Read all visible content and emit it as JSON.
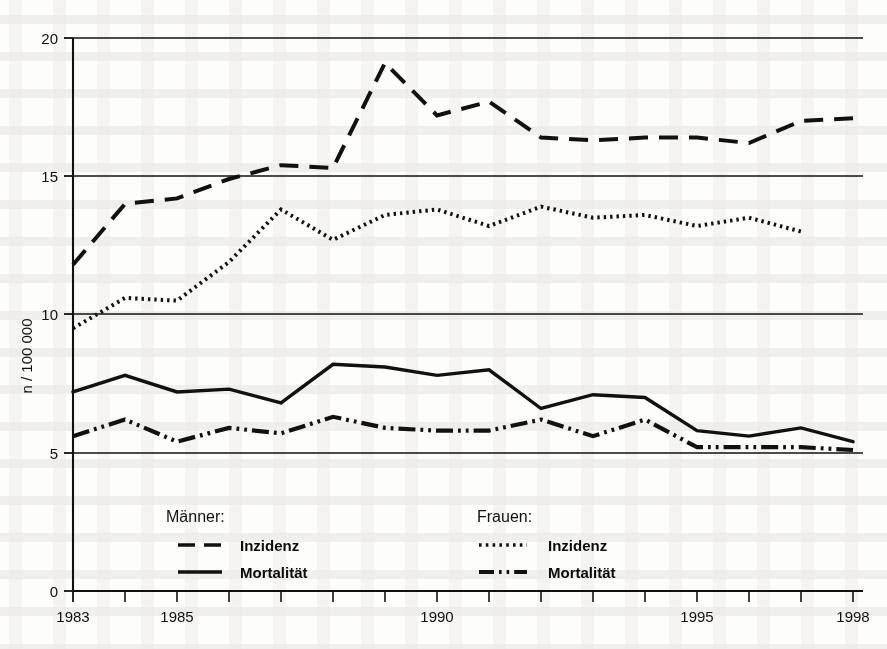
{
  "chart_data": {
    "type": "line",
    "title": "",
    "subtitle": "",
    "xlabel": "",
    "ylabel": "n / 100 000",
    "xlim": [
      1983,
      1998
    ],
    "ylim": [
      0,
      20
    ],
    "ytick_labels": [
      "0",
      "5",
      "10",
      "15",
      "20"
    ],
    "ytick_values": [
      0,
      5,
      10,
      15,
      20
    ],
    "xtick_values": [
      1983,
      1984,
      1985,
      1986,
      1987,
      1988,
      1989,
      1990,
      1991,
      1992,
      1993,
      1994,
      1995,
      1996,
      1997,
      1998
    ],
    "xtick_labels_shown": [
      "1983",
      "1985",
      "1990",
      "1995",
      "1998"
    ],
    "xtick_labeled_values": [
      1983,
      1985,
      1990,
      1995,
      1998
    ],
    "grid": "horizontal",
    "legend_position": "inside-bottom",
    "x": [
      1983,
      1984,
      1985,
      1986,
      1987,
      1988,
      1989,
      1990,
      1991,
      1992,
      1993,
      1994,
      1995,
      1996,
      1997,
      1998
    ],
    "series": [
      {
        "name": "Männer Inzidenz",
        "group": "Männer",
        "measure": "Inzidenz",
        "style": "dashed",
        "color": "#111111",
        "values": [
          11.8,
          14.0,
          14.2,
          14.9,
          15.4,
          15.3,
          19.1,
          17.2,
          17.7,
          16.4,
          16.3,
          16.4,
          16.4,
          16.2,
          17.0,
          17.1
        ]
      },
      {
        "name": "Frauen Inzidenz",
        "group": "Frauen",
        "measure": "Inzidenz",
        "style": "dotted",
        "color": "#111111",
        "values": [
          9.5,
          10.6,
          10.5,
          11.9,
          13.8,
          12.7,
          13.6,
          13.8,
          13.2,
          13.9,
          13.5,
          13.6,
          13.2,
          13.5,
          13.0,
          null
        ]
      },
      {
        "name": "Männer Mortalität",
        "group": "Männer",
        "measure": "Mortalität",
        "style": "solid",
        "color": "#111111",
        "values": [
          7.2,
          7.8,
          7.2,
          7.3,
          6.8,
          8.2,
          8.1,
          7.8,
          8.0,
          6.6,
          7.1,
          7.0,
          5.8,
          5.6,
          5.9,
          5.4
        ]
      },
      {
        "name": "Frauen Mortalität",
        "group": "Frauen",
        "measure": "Mortalität",
        "style": "dash-dot-dot",
        "color": "#111111",
        "values": [
          5.6,
          6.2,
          5.4,
          5.9,
          5.7,
          6.3,
          5.9,
          5.8,
          5.8,
          6.2,
          5.6,
          6.2,
          5.2,
          5.2,
          5.2,
          5.1
        ]
      }
    ]
  },
  "axes": {
    "y_axis_title": "n / 100 000",
    "y_ticks": [
      "20",
      "15",
      "10",
      "5",
      "0"
    ],
    "x_ticks": [
      "1983",
      "1985",
      "1990",
      "1995",
      "1998"
    ]
  },
  "legend": {
    "groups": [
      {
        "heading": "Männer:",
        "entries": [
          {
            "label": "Inzidenz",
            "style": "dashed"
          },
          {
            "label": "Mortalität",
            "style": "solid"
          }
        ]
      },
      {
        "heading": "Frauen:",
        "entries": [
          {
            "label": "Inzidenz",
            "style": "dotted"
          },
          {
            "label": "Mortalität",
            "style": "dash-dot-dot"
          }
        ]
      }
    ]
  }
}
